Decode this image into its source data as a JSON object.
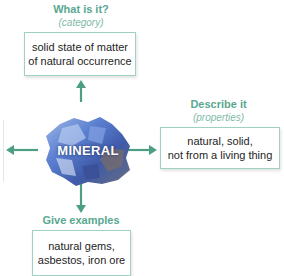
{
  "center": {
    "label": "MINERAL",
    "image": "mineral-crystal"
  },
  "top": {
    "heading": "What is it?",
    "subheading": "(category)",
    "lines": [
      "solid state of matter",
      "of natural occurrence"
    ]
  },
  "right": {
    "heading": "Describe it",
    "subheading": "(properties)",
    "lines": [
      "natural, solid,",
      "not from a living thing"
    ]
  },
  "bottom": {
    "heading": "Give examples",
    "lines": [
      "natural gems,",
      "asbestos, iron ore"
    ]
  },
  "colors": {
    "accent": "#5aa791",
    "arrow": "#4c9e85",
    "box_border": "#9fd0c2",
    "text": "#1e1e1e"
  }
}
